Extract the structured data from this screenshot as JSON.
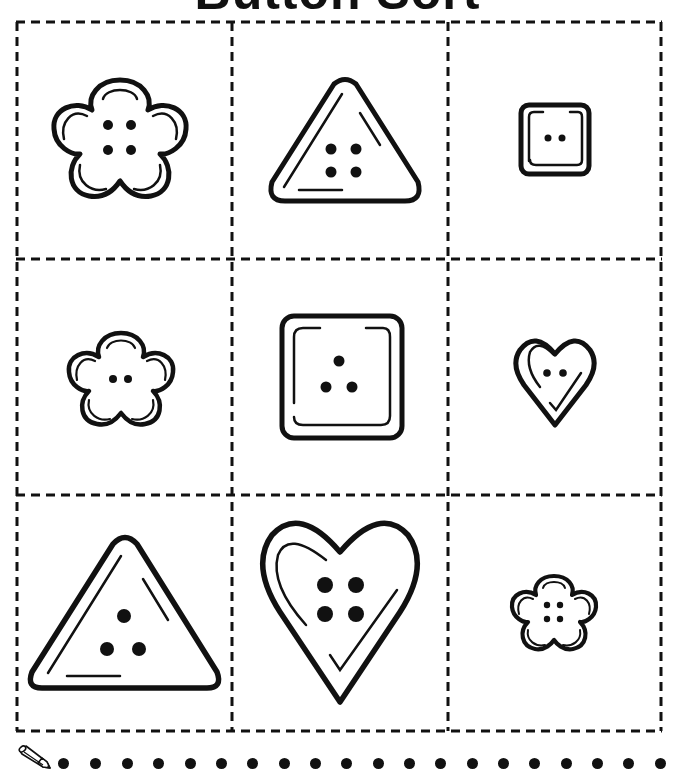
{
  "title": "Button Sort",
  "colors": {
    "ink": "#111111",
    "background": "#ffffff"
  },
  "grid": {
    "rows": 3,
    "columns": 3,
    "border_style": "dashed",
    "cells": [
      {
        "row": 1,
        "col": 1,
        "shape": "flower",
        "size": "large",
        "holes": 4
      },
      {
        "row": 1,
        "col": 2,
        "shape": "triangle",
        "size": "medium",
        "holes": 4
      },
      {
        "row": 1,
        "col": 3,
        "shape": "square",
        "size": "small",
        "holes": 2
      },
      {
        "row": 2,
        "col": 1,
        "shape": "flower",
        "size": "medium",
        "holes": 2
      },
      {
        "row": 2,
        "col": 2,
        "shape": "square",
        "size": "large",
        "holes": 3
      },
      {
        "row": 2,
        "col": 3,
        "shape": "heart",
        "size": "small",
        "holes": 2
      },
      {
        "row": 3,
        "col": 1,
        "shape": "triangle",
        "size": "large",
        "holes": 3
      },
      {
        "row": 3,
        "col": 2,
        "shape": "heart",
        "size": "large",
        "holes": 4
      },
      {
        "row": 3,
        "col": 3,
        "shape": "flower",
        "size": "small",
        "holes": 4
      }
    ]
  },
  "footer": {
    "icon": "pencil-icon",
    "dot_count": 20
  }
}
